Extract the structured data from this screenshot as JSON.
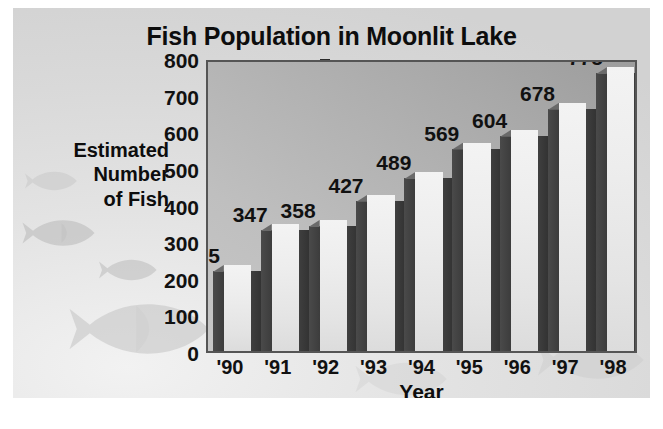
{
  "chart_data": {
    "type": "bar",
    "title": "Fish Population in Moonlit Lake",
    "xlabel": "Year",
    "ylabel": "Estimated Number of Fish",
    "ylabel_lines": [
      "Estimated",
      "Number",
      "of Fish"
    ],
    "categories": [
      "'90",
      "'91",
      "'92",
      "'93",
      "'94",
      "'95",
      "'96",
      "'97",
      "'98"
    ],
    "values": [
      235,
      347,
      358,
      427,
      489,
      569,
      604,
      678,
      775
    ],
    "value_labels": [
      "235",
      "347",
      "358",
      "427",
      "489",
      "569",
      "604",
      "678",
      "775"
    ],
    "ylim": [
      0,
      800
    ],
    "ytick_values": [
      0,
      100,
      200,
      300,
      400,
      500,
      600,
      700,
      800
    ],
    "ytick_labels": [
      "0",
      "100",
      "200",
      "300",
      "400",
      "500",
      "600",
      "700",
      "800"
    ],
    "grid": false,
    "legend": null,
    "data_labels_shown": true,
    "style": "3d-bar",
    "colors": {
      "bar_face": "#ededed",
      "bar_side": "#3f3f3f",
      "plot_background": "#b2b2b2",
      "canvas_background": "#e0e0e0",
      "text": "#111111",
      "axis": "#555555"
    },
    "decorations": "fish-silhouette-watermarks"
  }
}
